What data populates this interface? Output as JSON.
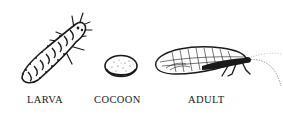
{
  "diagram": {
    "stages": [
      {
        "id": "larva",
        "label": "LARVA",
        "icon": "larva-illustration"
      },
      {
        "id": "cocoon",
        "label": "COCOON",
        "icon": "cocoon-illustration"
      },
      {
        "id": "adult",
        "label": "ADULT",
        "icon": "adult-lacewing-illustration"
      }
    ]
  },
  "colors": {
    "background": "#ffffff",
    "ink": "#1a1a1a"
  }
}
